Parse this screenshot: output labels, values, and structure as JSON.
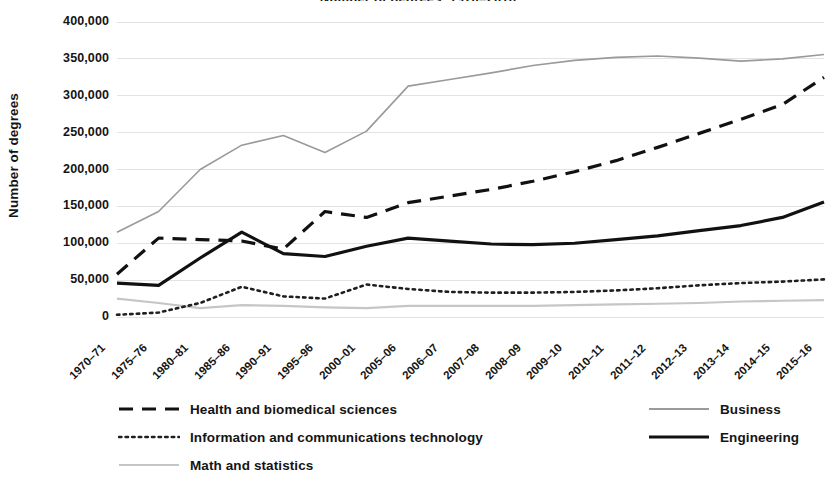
{
  "chart_data": {
    "type": "line",
    "title": "Number of degrees, 1970–2016",
    "xlabel": "",
    "ylabel": "Number of degrees",
    "ylim": [
      0,
      400000
    ],
    "ytick_step": 50000,
    "ytick_labels": [
      "0",
      "50,000",
      "100,000",
      "150,000",
      "200,000",
      "250,000",
      "300,000",
      "350,000",
      "400,000"
    ],
    "ytick_values": [
      0,
      50000,
      100000,
      150000,
      200000,
      250000,
      300000,
      350000,
      400000
    ],
    "grid": true,
    "grid_axis": "y",
    "legend_position": "bottom",
    "categories": [
      "1970–71",
      "1975–76",
      "1980–81",
      "1985–86",
      "1990–91",
      "1995–96",
      "2000–01",
      "2005–06",
      "2006–07",
      "2007–08",
      "2008–09",
      "2009–10",
      "2010–11",
      "2011–12",
      "2012–13",
      "2013–14",
      "2014–15",
      "2015–16"
    ],
    "series": [
      {
        "name": "Business",
        "style": "solid-thin",
        "color": "#9a9a9a",
        "width": 1.6,
        "values": [
          115000,
          143000,
          200000,
          233000,
          246000,
          223000,
          252000,
          313000,
          322000,
          331000,
          341000,
          348000,
          352000,
          354000,
          351000,
          347000,
          350000,
          356000
        ]
      },
      {
        "name": "Health and biomedical sciences",
        "style": "dashed",
        "color": "#111111",
        "width": 3.2,
        "values": [
          58000,
          107000,
          105000,
          103000,
          92000,
          143000,
          135000,
          155000,
          164000,
          173000,
          184000,
          197000,
          212000,
          230000,
          249000,
          268000,
          288000,
          325000
        ]
      },
      {
        "name": "Engineering",
        "style": "solid-thick",
        "color": "#111111",
        "width": 3.2,
        "values": [
          46000,
          43000,
          80000,
          115000,
          86000,
          82000,
          96000,
          107000,
          103000,
          99000,
          98000,
          100000,
          105000,
          110000,
          117000,
          124000,
          135000,
          156000
        ]
      },
      {
        "name": "Information and communications technology",
        "style": "dotted",
        "color": "#1f1f1f",
        "width": 2.6,
        "values": [
          3000,
          6000,
          19000,
          41000,
          28000,
          25000,
          44000,
          38000,
          34000,
          33000,
          33000,
          34000,
          36000,
          39000,
          43000,
          46000,
          48000,
          51000
        ]
      },
      {
        "name": "Math and statistics",
        "style": "solid-thin",
        "color": "#c6c6c6",
        "width": 2.2,
        "values": [
          25000,
          19000,
          12000,
          16000,
          15000,
          13000,
          12000,
          15000,
          15000,
          15000,
          15000,
          16000,
          17000,
          18000,
          19000,
          21000,
          22000,
          23000
        ]
      }
    ],
    "legend_entries": [
      {
        "label": "Health and biomedical sciences",
        "style": "dashed",
        "color": "#111111",
        "width": 3.2,
        "column": "left",
        "row": 0
      },
      {
        "label": "Information and communications technology",
        "style": "dotted",
        "color": "#1f1f1f",
        "width": 2.6,
        "column": "left",
        "row": 1
      },
      {
        "label": "Math and statistics",
        "style": "solid-thin",
        "color": "#c6c6c6",
        "width": 2.2,
        "column": "left",
        "row": 2
      },
      {
        "label": "Business",
        "style": "solid-thin",
        "color": "#9a9a9a",
        "width": 1.8,
        "column": "right",
        "row": 0
      },
      {
        "label": "Engineering",
        "style": "solid-thick",
        "color": "#111111",
        "width": 3.2,
        "column": "right",
        "row": 1
      }
    ],
    "colors": {
      "grid": "#e2e2e2",
      "axis_text": "#141414",
      "background": "#ffffff"
    }
  }
}
